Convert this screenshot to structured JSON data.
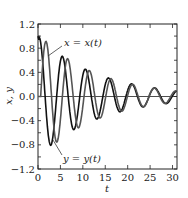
{
  "chart_data": {
    "type": "line",
    "title": "",
    "xlabel": "t",
    "ylabel": "x, y",
    "xlim": [
      0,
      31
    ],
    "ylim": [
      -1.2,
      1.2
    ],
    "grid": false,
    "x_ticks": [
      "0",
      "5",
      "10",
      "15",
      "20",
      "25",
      "30"
    ],
    "y_ticks": [
      "1.2",
      "0.8",
      "0.4",
      "0.0",
      "−0.4",
      "−0.8",
      "−1.2"
    ],
    "series": [
      {
        "name": "x = x(t)",
        "description": "damped oscillation, starts at 1.0, decays",
        "x": [
          0,
          0.5,
          1.7,
          3.5,
          5.7,
          8,
          10.5,
          13,
          15,
          17.5,
          20,
          22,
          24.5,
          27,
          29,
          31
        ],
        "values": [
          1.0,
          0.85,
          0.85,
          -0.4,
          0.5,
          -0.35,
          0.33,
          -0.25,
          0.2,
          -0.17,
          0.12,
          -0.1,
          0.1,
          -0.07,
          0.05,
          0.03
        ]
      },
      {
        "name": "y = y(t)",
        "description": "damped oscillation lagging x, min about -0.75 near t=3",
        "x": [
          0,
          0.8,
          3,
          5.5,
          7.7,
          10,
          12.3,
          14.7,
          17,
          19.3,
          21.7,
          24,
          26.3,
          28.7,
          31
        ],
        "values": [
          0.0,
          0.98,
          -0.73,
          0.53,
          -0.4,
          0.38,
          -0.3,
          0.25,
          -0.2,
          0.17,
          -0.15,
          0.12,
          -0.1,
          0.07,
          -0.05
        ]
      }
    ],
    "annotations": [
      {
        "text": "x = x(t)",
        "target_series": 0
      },
      {
        "text": "y = y(t)",
        "target_series": 1
      }
    ],
    "legend": "inline annotations with leader lines"
  }
}
